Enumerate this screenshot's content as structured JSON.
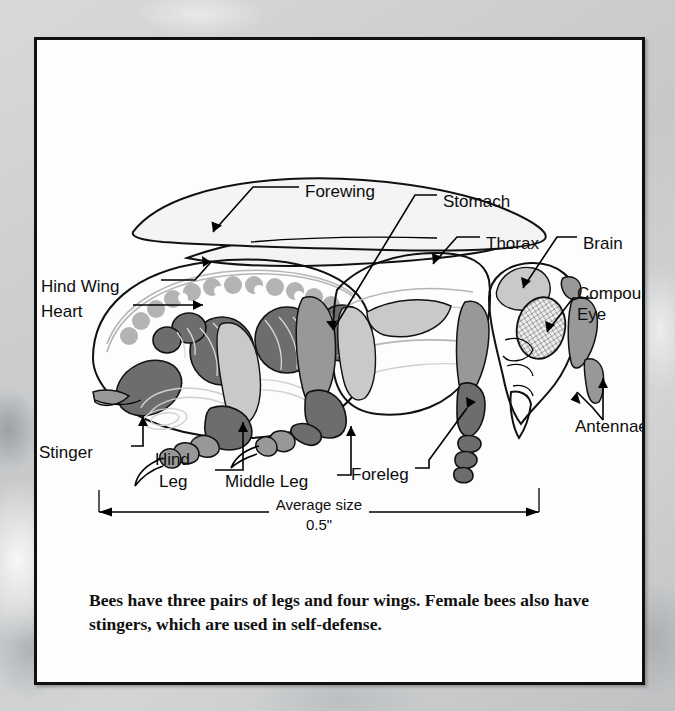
{
  "figure": {
    "subject": "bee",
    "labels": [
      {
        "id": "forewing",
        "text": "Forewing",
        "x": 268,
        "y": 151
      },
      {
        "id": "stomach",
        "text": "Stomach",
        "x": 406,
        "y": 161
      },
      {
        "id": "thorax",
        "text": "Thorax",
        "x": 449,
        "y": 203
      },
      {
        "id": "brain",
        "text": "Brain",
        "x": 546,
        "y": 203
      },
      {
        "id": "compound-eye",
        "text": "Compound",
        "x": 562,
        "y": 253
      },
      {
        "id": "compound-eye2",
        "text": "Eye",
        "x": 562,
        "y": 274
      },
      {
        "id": "hind-wing",
        "text": "Hind Wing",
        "x": 40,
        "y": 246
      },
      {
        "id": "heart",
        "text": "Heart",
        "x": 40,
        "y": 271
      },
      {
        "id": "stinger",
        "text": "Stinger",
        "x": 38,
        "y": 412
      },
      {
        "id": "hind-leg",
        "text": "Hind",
        "x": 150,
        "y": 419
      },
      {
        "id": "hind-leg2",
        "text": "Leg",
        "x": 153,
        "y": 441
      },
      {
        "id": "middle-leg",
        "text": "Middle Leg",
        "x": 222,
        "y": 441
      },
      {
        "id": "foreleg",
        "text": "Foreleg",
        "x": 385,
        "y": 434
      },
      {
        "id": "antennae",
        "text": "Antennae",
        "x": 573,
        "y": 386
      }
    ],
    "dimension": {
      "line_label": "Average size",
      "value_label": "0.5\"",
      "left_x": 96,
      "right_x": 536,
      "y": 508
    }
  },
  "caption": {
    "text": "Bees have three pairs of legs and four wings. Female bees also have stingers, which are used in self-defense."
  },
  "colors": {
    "panel_background": "#fdfdfd",
    "panel_border": "#111111",
    "page_background": "#cfd1d2",
    "organ_dark": "#6d6d6d",
    "organ_mid": "#989898",
    "organ_light": "#c9c9c9",
    "wing_fill": "#f4f4f4",
    "ink": "#0d0d0d"
  }
}
